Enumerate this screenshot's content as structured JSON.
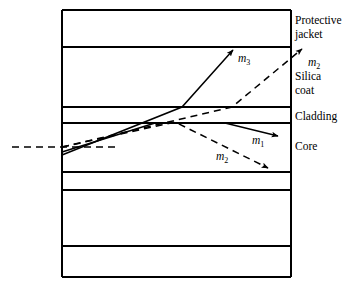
{
  "figure": {
    "kind": "optical-fiber-ray-propagation-diagram",
    "background_color": "#ffffff",
    "line_color": "#000000",
    "box": {
      "x": 62,
      "y": 10,
      "width": 229,
      "height": 267
    }
  },
  "layers": {
    "boundaries_y": [
      10,
      47,
      107,
      123,
      172,
      190,
      246,
      277
    ],
    "labels": [
      {
        "id": "protective-jacket",
        "text": "Protective\njacket",
        "x": 295,
        "y": 14
      },
      {
        "id": "silica-coat",
        "text": "Silica\ncoat",
        "x": 295,
        "y": 70
      },
      {
        "id": "cladding",
        "text": "Cladding",
        "x": 295,
        "y": 110
      },
      {
        "id": "core",
        "text": "Core",
        "x": 295,
        "y": 140
      }
    ]
  },
  "rays": {
    "incident": {
      "id": "incident-ray",
      "style": "dashed",
      "points": [
        [
          12,
          147
        ],
        [
          120,
          147
        ]
      ]
    },
    "m1": {
      "id": "ray-m1",
      "style": "solid",
      "arrow": true,
      "points": [
        [
          62,
          152
        ],
        [
          155,
          123
        ],
        [
          225,
          123
        ],
        [
          278,
          136
        ]
      ],
      "label": {
        "text": "m",
        "sub": "1",
        "x": 252,
        "y": 134
      }
    },
    "m2_lower": {
      "id": "ray-m2-lower",
      "style": "dashed",
      "arrow": true,
      "points": [
        [
          62,
          147
        ],
        [
          175,
          122
        ],
        [
          268,
          168
        ]
      ],
      "label": {
        "text": "m",
        "sub": "2",
        "x": 216,
        "y": 150
      }
    },
    "m2_upper": {
      "id": "ray-m2-upper",
      "style": "dashed",
      "arrow": true,
      "points": [
        [
          62,
          147
        ],
        [
          232,
          107
        ],
        [
          302,
          49
        ]
      ],
      "label": {
        "text": "m",
        "sub": "2",
        "x": 308,
        "y": 56
      }
    },
    "m3": {
      "id": "ray-m3",
      "style": "solid",
      "arrow": true,
      "points": [
        [
          62,
          155
        ],
        [
          182,
          107
        ],
        [
          233,
          50
        ]
      ],
      "label": {
        "text": "m",
        "sub": "3",
        "x": 238,
        "y": 52
      }
    }
  }
}
